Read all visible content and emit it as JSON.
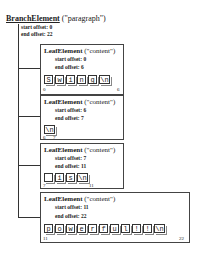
{
  "branch": {
    "name": "BranchElement",
    "type": "(\"paragraph\")",
    "start_offset": "start offset: 0",
    "end_offset": "end offset: 22"
  },
  "leaves": [
    {
      "name": "LeafElement",
      "type": "(\"content\")",
      "start_offset": "start offset: 0",
      "end_offset": "end offset: 6",
      "chars": [
        "S",
        "w",
        "i",
        "n",
        "g",
        "\\n"
      ],
      "start_idx": "0",
      "end_idx": "6"
    },
    {
      "name": "LeafElement",
      "type": "(\"content\")",
      "start_offset": "start offset: 6",
      "end_offset": "end offset: 7",
      "chars": [
        "\\n"
      ],
      "start_idx": "6",
      "end_idx": "7"
    },
    {
      "name": "LeafElement",
      "type": "(\"content\")",
      "start_offset": "start offset: 7",
      "end_offset": "end offset: 11",
      "chars": [
        " ",
        "i",
        "s",
        "\\n"
      ],
      "start_idx": "7",
      "end_idx": "11"
    },
    {
      "name": "LeafElement",
      "type": "(\"content\")",
      "start_offset": "start offset: 11",
      "end_offset": "end offset: 22",
      "chars": [
        "p",
        "o",
        "w",
        "e",
        "r",
        "f",
        "u",
        "l",
        "!",
        "!",
        "\\n"
      ],
      "start_idx": "11",
      "end_idx": "22"
    }
  ]
}
